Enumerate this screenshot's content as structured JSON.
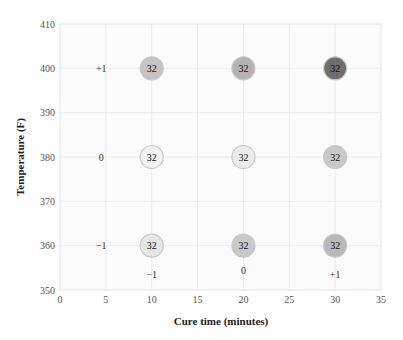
{
  "chart_data": {
    "type": "scatter",
    "title": "",
    "xlabel": "Cure time (minutes)",
    "ylabel": "Temperature (F)",
    "xlim": [
      0,
      35
    ],
    "ylim": [
      350,
      410
    ],
    "xticks": [
      0,
      5,
      10,
      15,
      20,
      25,
      30,
      35
    ],
    "yticks": [
      350,
      360,
      370,
      380,
      390,
      400,
      410
    ],
    "grid": true,
    "legend": null,
    "points": [
      {
        "x": 10,
        "y": 400,
        "label": "32",
        "fill": "#c4c4c4"
      },
      {
        "x": 20,
        "y": 400,
        "label": "32",
        "fill": "#b3b3b3"
      },
      {
        "x": 30,
        "y": 400,
        "label": "32",
        "fill": "#6e6e6e"
      },
      {
        "x": 10,
        "y": 380,
        "label": "32",
        "fill": "#f2f2f2"
      },
      {
        "x": 20,
        "y": 380,
        "label": "32",
        "fill": "#ececec"
      },
      {
        "x": 30,
        "y": 380,
        "label": "32",
        "fill": "#c8c8c8"
      },
      {
        "x": 10,
        "y": 360,
        "label": "32",
        "fill": "#e6e6e6"
      },
      {
        "x": 20,
        "y": 360,
        "label": "32",
        "fill": "#c9c9c9"
      },
      {
        "x": 30,
        "y": 360,
        "label": "32",
        "fill": "#b8b8b8"
      }
    ],
    "annotations": [
      {
        "x": 4.5,
        "y": 400,
        "text": "+1",
        "role": "temperature-level-code"
      },
      {
        "x": 4.5,
        "y": 380,
        "text": "0",
        "role": "temperature-level-code"
      },
      {
        "x": 4.5,
        "y": 360,
        "text": "−1",
        "role": "temperature-level-code"
      },
      {
        "x": 10,
        "y": 353.5,
        "text": "−1",
        "role": "time-level-code"
      },
      {
        "x": 20,
        "y": 354.3,
        "text": "0",
        "role": "time-level-code"
      },
      {
        "x": 30,
        "y": 353.5,
        "text": "+1",
        "role": "time-level-code"
      }
    ]
  }
}
